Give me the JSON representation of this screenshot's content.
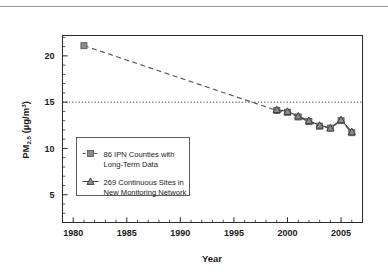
{
  "chart_data": {
    "type": "line",
    "title": "",
    "xlabel": "Year",
    "ylabel": "PM2.5 (ug/m3)",
    "ylabel_parts": {
      "base": "PM",
      "subscript": "2.5",
      "units_open": " (µg/m",
      "superscript": "3",
      "units_close": ")"
    },
    "xlim": [
      1979.0,
      2007.0
    ],
    "ylim": [
      2.0,
      22.2
    ],
    "x_ticks": [
      1980,
      1985,
      1990,
      1995,
      2000,
      2005
    ],
    "x_tick_labels": [
      "1980",
      "1985",
      "1990",
      "1995",
      "2000",
      "2005"
    ],
    "x_minor_tick_step": 1,
    "y_ticks": [
      5,
      10,
      15,
      20
    ],
    "y_tick_labels": [
      "5",
      "10",
      "15",
      "20"
    ],
    "y_minor_tick_step": 1,
    "grid": false,
    "legend_position": "lower-left-inside",
    "reference_lines": [
      {
        "name": "annual-standard-15",
        "axis": "y",
        "value": 15,
        "style": "dotted",
        "color": "#555555",
        "label": ""
      }
    ],
    "series": [
      {
        "name": "86 IPN Counties with Long-Term Data",
        "marker": "square",
        "line_style": "dashed",
        "color": "#5a5a5a",
        "marker_face": "#8c8c8c",
        "x": [
          1981,
          1999,
          2000,
          2001,
          2002,
          2003,
          2004,
          2005,
          2006
        ],
        "values": [
          21.1,
          14.1,
          13.9,
          13.4,
          12.9,
          12.4,
          12.2,
          13.0,
          11.7
        ]
      },
      {
        "name": "269 Continuous Sites in New Monitoring Network",
        "marker": "triangle",
        "line_style": "solid",
        "color": "#3a3a3a",
        "marker_face": "#8c8c8c",
        "x": [
          1999,
          2000,
          2001,
          2002,
          2003,
          2004,
          2005,
          2006
        ],
        "values": [
          14.2,
          14.0,
          13.5,
          13.0,
          12.5,
          12.2,
          13.1,
          11.8
        ]
      }
    ],
    "legend_entries": [
      {
        "marker": "square",
        "line_style": "dashed",
        "line1": "86 IPN Counties with",
        "line2": "Long-Term Data"
      },
      {
        "marker": "triangle",
        "line_style": "solid",
        "line1": "269 Continuous Sites in",
        "line2": "New Monitoring Network"
      }
    ]
  },
  "colors": {
    "background": "#ffffff",
    "axis": "#2b2b2b",
    "text": "#1a1a1a",
    "series1_line": "#5a5a5a",
    "series2_line": "#3a3a3a",
    "marker_fill": "#8c8c8c",
    "reference_line": "#555555",
    "top_rule": "#9a9a9a"
  }
}
